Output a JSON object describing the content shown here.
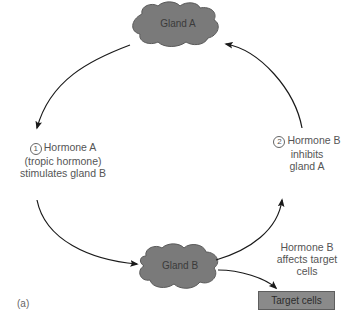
{
  "diagram": {
    "panel_label": "(a)",
    "nodes": {
      "gland_a": {
        "label": "Gland A",
        "color": "#7a7a7a"
      },
      "gland_b": {
        "label": "Gland B",
        "color": "#7a7a7a"
      },
      "target_cells": {
        "label": "Target cells",
        "color": "#8a8a8a"
      }
    },
    "steps": {
      "step1": {
        "number": "1",
        "line1": "Hormone A",
        "line2": "(tropic hormone)",
        "line3": "stimulates gland B"
      },
      "step2": {
        "number": "2",
        "line1": "Hormone B",
        "line2": "inhibits",
        "line3": "gland A"
      },
      "effect": {
        "line1": "Hormone B",
        "line2": "affects target",
        "line3": "cells"
      }
    },
    "edges": [
      {
        "from": "Gland A",
        "to": "Gland B",
        "label": "Hormone A (tropic hormone) stimulates gland B"
      },
      {
        "from": "Gland B",
        "to": "Gland A",
        "label": "Hormone B inhibits gland A"
      },
      {
        "from": "Gland B",
        "to": "Target cells",
        "label": "Hormone B affects target cells"
      }
    ]
  }
}
